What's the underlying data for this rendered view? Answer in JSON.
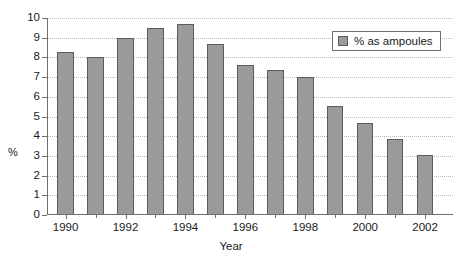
{
  "chart_data": {
    "type": "bar",
    "title": "",
    "xlabel": "Year",
    "ylabel": "%",
    "ylim": [
      0,
      10
    ],
    "ytick_step": 1,
    "yticks": [
      "10",
      "9",
      "8",
      "7",
      "6",
      "5",
      "4",
      "3",
      "2",
      "1",
      "0"
    ],
    "grid": true,
    "grid_style": "dotted-horizontal",
    "legend_position": "top-right",
    "legend": [
      "% as ampoules"
    ],
    "series": [
      {
        "name": "% as ampoules",
        "color": "#9a9a9a",
        "values": [
          8.3,
          8.0,
          9.0,
          9.5,
          9.7,
          8.7,
          7.6,
          7.35,
          7.0,
          5.55,
          4.65,
          3.85,
          3.05
        ]
      }
    ],
    "categories": [
      "1990",
      "1991",
      "1992",
      "1993",
      "1994",
      "1995",
      "1996",
      "1997",
      "1998",
      "1999",
      "2000",
      "2001",
      "2002"
    ],
    "xtick_labels": [
      "1990",
      "1992",
      "1994",
      "1996",
      "1998",
      "2000",
      "2002"
    ]
  },
  "legend": {
    "entries": [
      {
        "label": "% as ampoules",
        "color": "#9a9a9a"
      }
    ]
  },
  "axes": {
    "y_title": "%",
    "x_title": "Year"
  },
  "colors": {
    "bar_fill": "#9a9a9a",
    "bar_stroke": "#5c5c5c",
    "axis": "#6e6e6e",
    "grid": "#b9b9b9",
    "background": "#ffffff"
  }
}
